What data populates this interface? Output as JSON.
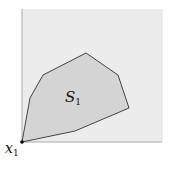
{
  "diagram": {
    "region": {
      "x": 22,
      "y": 9,
      "width": 140,
      "height": 133,
      "fill": "#ececec",
      "border": "#bdbdbd"
    },
    "polygon": {
      "points": "22,142 30,98 43,75 86,53 118,75 129,108 75,131",
      "fill": "#d4d4d4",
      "stroke": "#444444"
    },
    "point": {
      "x": 22,
      "y": 142,
      "color": "#000000"
    },
    "labels": {
      "set": {
        "base": "S",
        "sub": "1"
      },
      "point": {
        "base": "x",
        "sub": "1"
      }
    }
  }
}
